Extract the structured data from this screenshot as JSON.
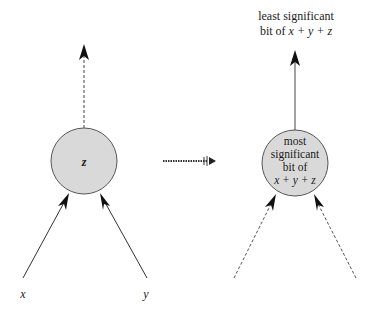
{
  "diagram": {
    "left": {
      "node_label": "z",
      "input_left_label": "x",
      "input_right_label": "y"
    },
    "transform_arrow": "dotted-arrow",
    "right": {
      "output_label_line1": "least significant",
      "output_label_line2_prefix": "bit of ",
      "output_label_line2_expr": "x + y + z",
      "node_label_line1": "most",
      "node_label_line2": "significant",
      "node_label_line3": "bit of",
      "node_label_line4": "x + y + z"
    },
    "colors": {
      "node_fill": "#d9d9d9",
      "node_stroke": "#555555",
      "line": "#333333"
    }
  }
}
